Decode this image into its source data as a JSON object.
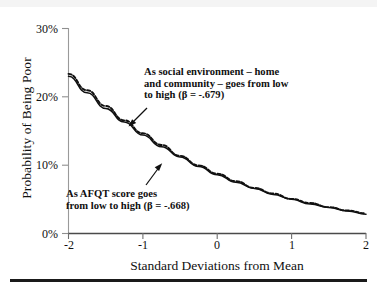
{
  "figure": {
    "background_color": "#ffffff",
    "ink_color": "#101010"
  },
  "chart_data": {
    "type": "line",
    "title": "",
    "subtitle": "",
    "xlabel": "Standard Deviations from Mean",
    "ylabel": "Probability of Being Poor",
    "xlim": [
      -2,
      2
    ],
    "ylim": [
      0,
      30
    ],
    "grid": false,
    "legend_position": "none",
    "x_tick_labels": [
      "-2",
      "-1",
      "0",
      "1",
      "2"
    ],
    "x_tick_values": [
      -2,
      -1,
      0,
      1,
      2
    ],
    "y_tick_labels": [
      "0%",
      "10%",
      "20%",
      "30%"
    ],
    "y_tick_values": [
      0,
      10,
      20,
      30
    ],
    "x": [
      -2,
      -1.75,
      -1.5,
      -1.25,
      -1,
      -0.75,
      -0.5,
      -0.25,
      0,
      0.25,
      0.5,
      0.75,
      1,
      1.25,
      1.5,
      1.75,
      2
    ],
    "series": [
      {
        "name": "As AFQT score goes from low to high",
        "beta": "-.668",
        "style": "solid",
        "color": "#101010",
        "values": [
          23.0,
          20.6,
          18.3,
          16.3,
          14.4,
          12.7,
          11.2,
          9.8,
          8.6,
          7.5,
          6.6,
          5.7,
          5.0,
          4.3,
          3.8,
          3.3,
          2.8
        ]
      },
      {
        "name": "As social environment - home and community - goes from low to high",
        "beta": "-.679",
        "style": "dashed",
        "color": "#101010",
        "values": [
          23.2,
          20.8,
          18.5,
          16.4,
          14.5,
          12.8,
          11.2,
          9.8,
          8.6,
          7.5,
          6.5,
          5.7,
          4.9,
          4.3,
          3.7,
          3.2,
          2.8
        ]
      }
    ],
    "annotations": [
      {
        "id": "social-environment",
        "text": "As social environment  – home\nand community – goes from low\nto high (β = -.679)",
        "arrow": "down-left",
        "target_x": -1.18,
        "target_y": 15.0
      },
      {
        "id": "afqt-score",
        "text": "As AFQT score goes\nfrom low to high (β = -.668)",
        "arrow": "up-right",
        "target_x": -0.72,
        "target_y": 11.3
      }
    ]
  }
}
